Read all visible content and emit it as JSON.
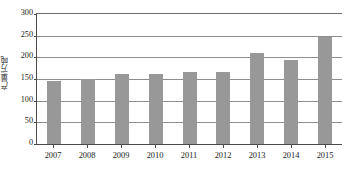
{
  "chart_data": {
    "type": "bar",
    "title": "",
    "subtitle": "",
    "xlabel": "",
    "ylabel": "产量/万吨",
    "categories": [
      "2007",
      "2008",
      "2009",
      "2010",
      "2011",
      "2012",
      "2013",
      "2014",
      "2015"
    ],
    "values": [
      146,
      151,
      162,
      162,
      166,
      166,
      211,
      195,
      248
    ],
    "series": [
      {
        "name": "产量",
        "values": [
          146,
          151,
          162,
          162,
          166,
          166,
          211,
          195,
          248
        ]
      }
    ],
    "ylim": [
      0,
      300
    ],
    "yticks": [
      0,
      50,
      100,
      150,
      200,
      250,
      300
    ],
    "ytick_labels": [
      "0",
      "50",
      "100",
      "150",
      "200",
      "250",
      "300"
    ],
    "xtick_labels": [
      "2007",
      "2008",
      "2009",
      "2010",
      "2011",
      "2012",
      "2013",
      "2014",
      "2015"
    ],
    "grid": true,
    "grid_axis": "y",
    "legend": false,
    "legend_position": "none",
    "bar_color": "#989898",
    "axis_color": "#4a4a4a",
    "gridline_color": "#8d8d8d",
    "background": "#ffffff",
    "annotations": []
  }
}
